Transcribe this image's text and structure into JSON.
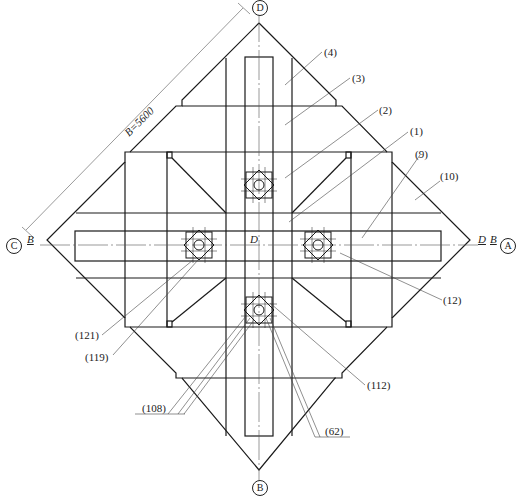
{
  "drawing": {
    "axes": {
      "top": "D",
      "right": "A",
      "bottom": "B",
      "left": "C"
    },
    "dimension": "B=5600",
    "axis_marks": {
      "left_B": "B",
      "center_D": "D",
      "right_D": "D",
      "right_B": "B"
    },
    "callouts": [
      {
        "id": "c4",
        "text": "(4)"
      },
      {
        "id": "c3",
        "text": "(3)"
      },
      {
        "id": "c2",
        "text": "(2)"
      },
      {
        "id": "c1",
        "text": "(1)"
      },
      {
        "id": "c9",
        "text": "(9)"
      },
      {
        "id": "c10",
        "text": "(10)"
      },
      {
        "id": "c12",
        "text": "(12)"
      },
      {
        "id": "c121",
        "text": "(121)"
      },
      {
        "id": "c119",
        "text": "(119)"
      },
      {
        "id": "c112",
        "text": "(112)"
      },
      {
        "id": "c108",
        "text": "(108)"
      },
      {
        "id": "c62",
        "text": "(62)"
      }
    ],
    "line_color": "#1a1a1a"
  }
}
